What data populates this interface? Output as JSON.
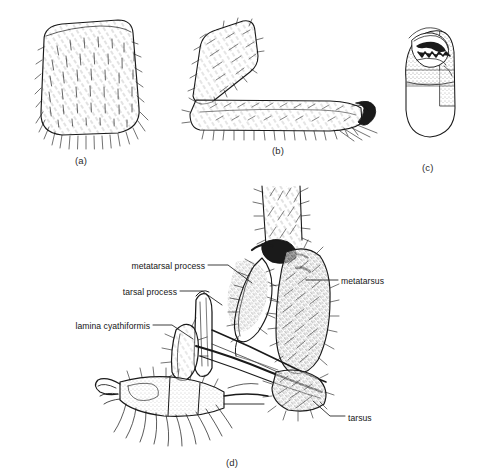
{
  "figure": {
    "background_color": "#ffffff",
    "ink_color": "#1a1a1a",
    "panel_count": 4
  },
  "panels": [
    {
      "id": "a",
      "letter": "(a)",
      "caption_x": 82,
      "caption_y": 162,
      "subject": "carapace-dorsal-view",
      "description": "Rounded trapezoidal sclerite densely covered with short erect setae and a fringe of long marginal setae along the ventral edge"
    },
    {
      "id": "b",
      "letter": "(b)",
      "caption_x": 278,
      "caption_y": 152,
      "subject": "leg-lateral-view",
      "description": "Bent leg showing an oblique proximal segment and an elongate distal segment bearing a dark curved terminal claw"
    },
    {
      "id": "c",
      "letter": "(c)",
      "caption_x": 428,
      "caption_y": 170,
      "subject": "chelicera",
      "description": "Ovoid chelicera with stippled shading and a row of dark serrated teeth bordering the cheliceral groove at the apex"
    },
    {
      "id": "d",
      "letter": "(d)",
      "caption_x": 232,
      "caption_y": 465,
      "subject": "male-palp-clasping-apparatus",
      "description": "Detailed lateral view of the metatarsus and tarsus bearing the metatarsal process, tarsal process and lamina cyathiformis"
    }
  ],
  "callouts": [
    {
      "id": "metatarsal-process",
      "label": "metatarsal process",
      "side": "left",
      "text_x": 205,
      "text_y": 267,
      "leader": {
        "x1": 208,
        "y1": 265,
        "x2": 228,
        "y2": 265,
        "x3": 252,
        "y3": 283
      }
    },
    {
      "id": "tarsal-process",
      "label": "tarsal process",
      "side": "left",
      "text_x": 177,
      "text_y": 293,
      "leader": {
        "x1": 180,
        "y1": 291,
        "x2": 202,
        "y2": 291,
        "x3": 222,
        "y3": 305
      }
    },
    {
      "id": "lamina-cyathiformis",
      "label": "lamina cyathiformis",
      "side": "left",
      "text_x": 150,
      "text_y": 327,
      "leader": {
        "x1": 153,
        "y1": 325,
        "x2": 172,
        "y2": 325,
        "x3": 193,
        "y3": 339
      }
    },
    {
      "id": "metatarsus",
      "label": "metatarsus",
      "side": "right",
      "text_x": 341,
      "text_y": 282,
      "leader": {
        "x1": 338,
        "y1": 280,
        "x2": 320,
        "y2": 280,
        "x3": 306,
        "y3": 280
      }
    },
    {
      "id": "tarsus",
      "label": "tarsus",
      "side": "right",
      "text_x": 348,
      "text_y": 419,
      "leader": {
        "x1": 345,
        "y1": 416,
        "x2": 330,
        "y2": 416,
        "x3": 313,
        "y3": 401
      }
    }
  ]
}
